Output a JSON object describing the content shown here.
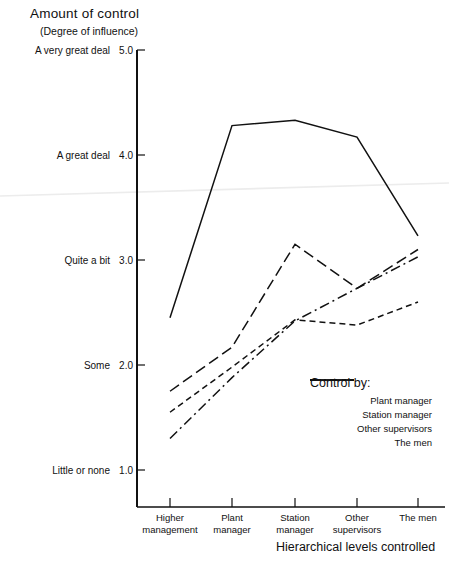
{
  "chart_data": {
    "type": "line",
    "title": "Amount of control",
    "subtitle": "(Degree of influence)",
    "xlabel": "Hierarchical levels controlled",
    "ylabel": "Amount of control",
    "categories": [
      "Higher management",
      "Plant manager",
      "Station manager",
      "Other supervisors",
      "The men"
    ],
    "ylim": [
      1.0,
      5.0
    ],
    "grid": false,
    "legend_position": "inside-lower-right",
    "legend_title": "Control by:",
    "ytick_values": [
      "5.0",
      "4.0",
      "3.0",
      "2.0",
      "1.0"
    ],
    "ytick_labels": [
      "A very great deal",
      "A great deal",
      "Quite a bit",
      "Some",
      "Little or none"
    ],
    "series": [
      {
        "name": "Plant manager",
        "style": "solid",
        "values": [
          2.45,
          4.28,
          4.33,
          4.17,
          3.23
        ]
      },
      {
        "name": "Station manager",
        "style": "long-dash",
        "values": [
          1.75,
          2.17,
          3.15,
          2.73,
          3.1
        ]
      },
      {
        "name": "Other supervisors",
        "style": "dash-dot",
        "values": [
          1.3,
          1.88,
          2.42,
          2.73,
          3.03
        ]
      },
      {
        "name": "The men",
        "style": "short-dash",
        "values": [
          1.55,
          1.98,
          2.43,
          2.38,
          2.6
        ]
      }
    ]
  },
  "axis": {
    "title_main": "Amount of control",
    "title_sub": "(Degree of influence)",
    "x_title": "Hierarchical levels controlled"
  },
  "ticks": {
    "y": [
      {
        "label": "A very great deal",
        "value": "5.0"
      },
      {
        "label": "A great deal",
        "value": "4.0"
      },
      {
        "label": "Quite a bit",
        "value": "3.0"
      },
      {
        "label": "Some",
        "value": "2.0"
      },
      {
        "label": "Little or none",
        "value": "1.0"
      }
    ],
    "x": [
      {
        "line1": "Higher",
        "line2": "management"
      },
      {
        "line1": "Plant",
        "line2": "manager"
      },
      {
        "line1": "Station",
        "line2": "manager"
      },
      {
        "line1": "Other",
        "line2": "supervisors"
      },
      {
        "line1": "The men",
        "line2": ""
      }
    ]
  },
  "legend": {
    "title": "Control by:",
    "items": [
      {
        "label": "Plant manager",
        "style": "solid"
      },
      {
        "label": "Station manager",
        "style": "long-dash"
      },
      {
        "label": "Other supervisors",
        "style": "dash-dot"
      },
      {
        "label": "The men",
        "style": "short-dash"
      }
    ]
  },
  "colors": {
    "ink": "#111111",
    "artifact": "#ececec",
    "background": "#ffffff"
  }
}
